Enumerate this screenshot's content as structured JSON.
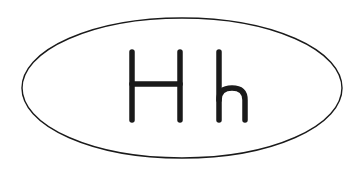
{
  "figure": {
    "letters": "Hh",
    "uppercase": "H",
    "lowercase": "h",
    "stroke_color": "#1a1a1a",
    "background_color": "#ffffff"
  }
}
